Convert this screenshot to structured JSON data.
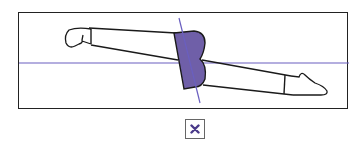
{
  "figure": {
    "description": "Prone body position diagram with highlighted trunk/hip region and reference axes",
    "highlight_color": "#6f5fa8",
    "axis_color": "#6a5fc0",
    "outline_color": "#1a1a1a"
  },
  "mark_button": {
    "icon": "x-mark-icon",
    "label": "incorrect",
    "color": "#4a3a8a"
  }
}
